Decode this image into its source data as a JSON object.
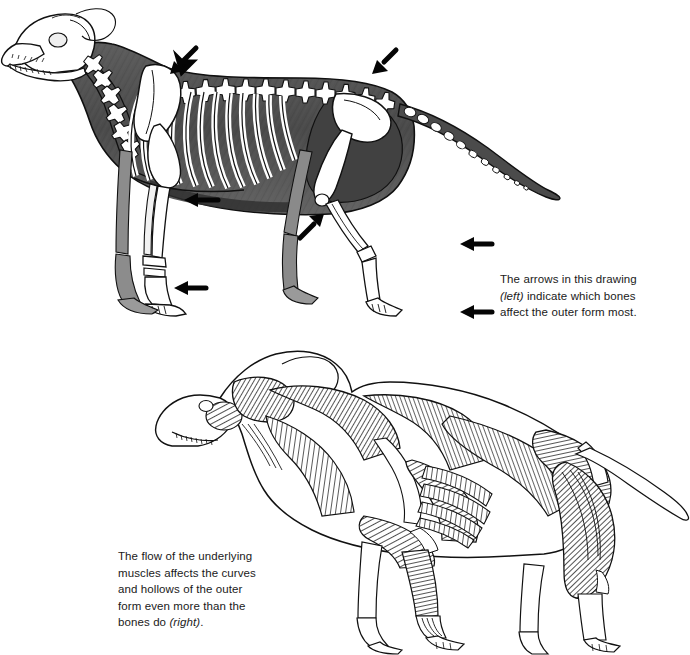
{
  "page": {
    "background_color": "#ffffff",
    "width": 690,
    "height": 655,
    "ink_color": "#1a1a1a"
  },
  "captions": {
    "arrows": {
      "lines": [
        {
          "text": "The arrows in this drawing",
          "italic": false
        },
        {
          "text": "(left)",
          "italic": true
        },
        {
          "text": " indicate which bones",
          "italic": false
        },
        {
          "text": "affect the outer form most.",
          "italic": false
        }
      ],
      "plain_text": "The arrows in this drawing (left) indicate which bones affect the outer form most."
    },
    "muscles": {
      "lines": [
        {
          "text": "The flow of the underlying",
          "italic": false
        },
        {
          "text": "muscles affects the curves",
          "italic": false
        },
        {
          "text": "and hollows of the outer",
          "italic": false
        },
        {
          "text": "form even more than the",
          "italic": false
        },
        {
          "text": "bones do ",
          "italic": false
        },
        {
          "text": "(right)",
          "italic": true
        },
        {
          "text": ".",
          "italic": false
        }
      ],
      "plain_text": "The flow of the underlying muscles affects the curves and hollows of the outer form even more than the bones do (right)."
    }
  },
  "figures": {
    "skeleton": {
      "name": "dog-skeleton-drawing",
      "subject": "standing dog with skeleton overlaid on dark body silhouette",
      "description": "Side view of a dog facing left; the body is filled with dark grey wash and the bones are rendered in white with black outlines.",
      "bones_shown": [
        "skull",
        "mandible with teeth",
        "cervical vertebrae",
        "scapula",
        "humerus",
        "radius and ulna",
        "carpals",
        "metacarpals and phalanges",
        "ribcage",
        "sternum",
        "thoracic vertebrae",
        "lumbar vertebrae",
        "pelvis",
        "femur",
        "patella",
        "tibia and fibula",
        "tarsals",
        "metatarsals",
        "caudal vertebrae of tail"
      ],
      "arrows": [
        {
          "id": "arrow-withers",
          "target": "top of scapula at withers",
          "direction": "down-left"
        },
        {
          "id": "arrow-pelvis-crest",
          "target": "crest of the pelvis",
          "direction": "down-left"
        },
        {
          "id": "arrow-elbow",
          "target": "elbow / olecranon",
          "direction": "left"
        },
        {
          "id": "arrow-stifle",
          "target": "stifle joint",
          "direction": "up-right"
        },
        {
          "id": "arrow-carpus",
          "target": "carpus of the front leg",
          "direction": "left"
        },
        {
          "id": "arrow-hock",
          "target": "hock joint",
          "direction": "left"
        },
        {
          "id": "arrow-rear-paw",
          "target": "rear paw",
          "direction": "left"
        }
      ],
      "arrow_count": 7
    },
    "muscle": {
      "name": "dog-musculature-drawing",
      "subject": "standing dog with surface musculature in pen hatching",
      "description": "Side view of a dog facing left, drawn with fine directional hatching showing muscle fiber flow; legs and tail left as open outline.",
      "muscles_shown": [
        "masseter",
        "temporalis",
        "brachiocephalicus",
        "trapezius",
        "deltoid",
        "triceps",
        "latissimus dorsi",
        "serratus ventralis",
        "external abdominal oblique",
        "pectorals",
        "gluteal group",
        "biceps femoris",
        "semitendinosus",
        "gastrocnemius",
        "extensor tendons"
      ]
    }
  }
}
